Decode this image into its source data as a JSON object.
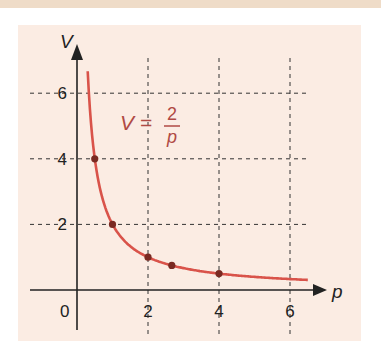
{
  "chart_data": {
    "type": "line",
    "title": "",
    "equation": {
      "lhs": "V =",
      "numerator": "2",
      "denominator": "p"
    },
    "xlabel": "p",
    "ylabel": "V",
    "origin_label": "0",
    "x_ticks": [
      "2",
      "4",
      "6"
    ],
    "y_ticks": [
      "2",
      "4",
      "6"
    ],
    "xlim": [
      0,
      6.6
    ],
    "ylim": [
      0,
      6.6
    ],
    "grid": "dashed at ticks",
    "series": [
      {
        "name": "V = 2/p",
        "function": "2/p",
        "p_range": [
          0.3,
          6.5
        ],
        "color": "#d9534a"
      }
    ],
    "points": [
      {
        "p": 0.5,
        "V": 4
      },
      {
        "p": 1,
        "V": 2
      },
      {
        "p": 2,
        "V": 1
      },
      {
        "p": 2.67,
        "V": 0.75
      },
      {
        "p": 4,
        "V": 0.5
      }
    ]
  },
  "colors": {
    "curve": "#d9534a",
    "point": "#7a2a22",
    "panel": "#fbece3",
    "axis": "#222222"
  }
}
